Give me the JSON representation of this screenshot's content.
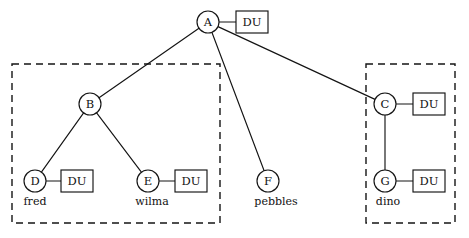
{
  "diagram": {
    "background_color": "#ffffff",
    "stroke_color": "#141414",
    "nodes": [
      {
        "id": "A",
        "label": "A",
        "cx": 208,
        "cy": 22,
        "r": 11,
        "person": ""
      },
      {
        "id": "B",
        "label": "B",
        "cx": 90,
        "cy": 104,
        "r": 11,
        "person": ""
      },
      {
        "id": "C",
        "label": "C",
        "cx": 385,
        "cy": 104,
        "r": 11,
        "person": ""
      },
      {
        "id": "D",
        "label": "D",
        "cx": 35,
        "cy": 181,
        "r": 11,
        "person": "fred"
      },
      {
        "id": "E",
        "label": "E",
        "cx": 148,
        "cy": 181,
        "r": 11,
        "person": "wilma"
      },
      {
        "id": "F",
        "label": "F",
        "cx": 268,
        "cy": 181,
        "r": 11,
        "person": "pebbles"
      },
      {
        "id": "G",
        "label": "G",
        "cx": 385,
        "cy": 181,
        "r": 11,
        "person": "dino"
      }
    ],
    "du_boxes": [
      {
        "for": "A",
        "label": "DU",
        "x": 236,
        "y": 11,
        "w": 32,
        "h": 22
      },
      {
        "for": "C",
        "label": "DU",
        "x": 413,
        "y": 93,
        "w": 32,
        "h": 22
      },
      {
        "for": "D",
        "label": "DU",
        "x": 61,
        "y": 170,
        "w": 32,
        "h": 22
      },
      {
        "for": "E",
        "label": "DU",
        "x": 175,
        "y": 170,
        "w": 32,
        "h": 22
      },
      {
        "for": "G",
        "label": "DU",
        "x": 413,
        "y": 170,
        "w": 32,
        "h": 22
      }
    ],
    "tree_edges": [
      {
        "from": "A",
        "to": "B"
      },
      {
        "from": "A",
        "to": "F"
      },
      {
        "from": "A",
        "to": "C"
      },
      {
        "from": "B",
        "to": "D"
      },
      {
        "from": "B",
        "to": "E"
      },
      {
        "from": "C",
        "to": "G"
      }
    ],
    "du_links": [
      {
        "from": "A",
        "to_box": 0
      },
      {
        "from": "C",
        "to_box": 1
      },
      {
        "from": "D",
        "to_box": 2
      },
      {
        "from": "E",
        "to_box": 3
      },
      {
        "from": "G",
        "to_box": 4
      }
    ],
    "person_labels": [
      {
        "for": "D",
        "text": "fred",
        "x": 35,
        "y": 205
      },
      {
        "for": "E",
        "text": "wilma",
        "x": 152,
        "y": 205
      },
      {
        "for": "F",
        "text": "pebbles",
        "x": 276,
        "y": 205
      },
      {
        "for": "G",
        "text": "dino",
        "x": 388,
        "y": 205
      }
    ],
    "group_boxes": [
      {
        "name": "left-group",
        "x": 12,
        "y": 64,
        "w": 208,
        "h": 159
      },
      {
        "name": "right-group",
        "x": 366,
        "y": 64,
        "w": 89,
        "h": 159
      }
    ]
  }
}
